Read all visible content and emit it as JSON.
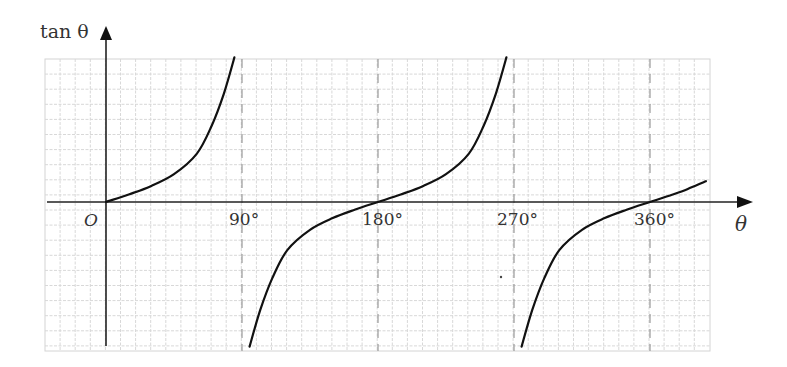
{
  "chart_data": {
    "type": "line",
    "title": "",
    "function": "tan θ",
    "ylabel": "tan θ",
    "xlabel": "θ",
    "origin_label": "O",
    "x_ticks": [
      {
        "deg": 90,
        "label": "90°"
      },
      {
        "deg": 180,
        "label": "180°"
      },
      {
        "deg": 270,
        "label": "270°"
      },
      {
        "deg": 360,
        "label": "360°"
      }
    ],
    "xlim_deg": [
      -45,
      400
    ],
    "asymptotes_deg": [
      90,
      270
    ],
    "reference_lines_deg": [
      90,
      180,
      270,
      360
    ],
    "grid": true,
    "series": [
      {
        "name": "branch-1",
        "x_deg": [
          0,
          15,
          30,
          45,
          60,
          70,
          78,
          85
        ],
        "y": [
          0,
          0.27,
          0.58,
          1.0,
          1.73,
          2.75,
          3.9,
          5.2
        ]
      },
      {
        "name": "branch-2",
        "x_deg": [
          95,
          102,
          110,
          120,
          135,
          150,
          165,
          180,
          195,
          210,
          225,
          240,
          250,
          258,
          265
        ],
        "y": [
          -5.2,
          -3.9,
          -2.75,
          -1.73,
          -1.0,
          -0.58,
          -0.27,
          0,
          0.27,
          0.58,
          1.0,
          1.73,
          2.75,
          3.9,
          5.2
        ]
      },
      {
        "name": "branch-3",
        "x_deg": [
          275,
          282,
          290,
          300,
          315,
          330,
          345,
          360,
          375,
          385,
          397
        ],
        "y": [
          -5.2,
          -3.9,
          -2.75,
          -1.73,
          -1.0,
          -0.58,
          -0.27,
          0,
          0.27,
          0.47,
          0.75
        ]
      }
    ]
  },
  "labels": {
    "y_axis": "tan θ",
    "x_axis": "θ",
    "origin": "O",
    "tick_90": "90°",
    "tick_180": "180°",
    "tick_270": "270°",
    "tick_360": "360°"
  }
}
